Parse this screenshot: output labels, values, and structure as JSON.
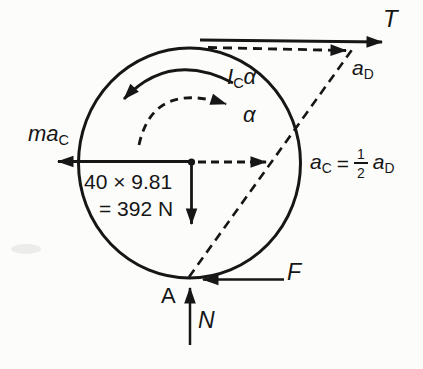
{
  "diagram": {
    "ink_color": "#161616",
    "background_color": "#fcfcfb",
    "top": {
      "tension_label": "T",
      "accel_d": {
        "base": "a",
        "sub": "D"
      }
    },
    "rotation": {
      "moment": {
        "base": "I",
        "sub": "C",
        "coeff": "α"
      },
      "alpha_label": "α"
    },
    "center": {
      "inertia_force": {
        "base": "ma",
        "sub": "C"
      },
      "weight_line1": "40 × 9.81",
      "weight_line2": "= 392 N"
    },
    "relation": {
      "lhs_base": "a",
      "lhs_sub": "C",
      "equals": "=",
      "numerator": "1",
      "denominator": "2",
      "rhs_base": "a",
      "rhs_sub": "D"
    },
    "contact": {
      "friction_label": "F",
      "point_label": "A",
      "normal_label": "N"
    }
  }
}
